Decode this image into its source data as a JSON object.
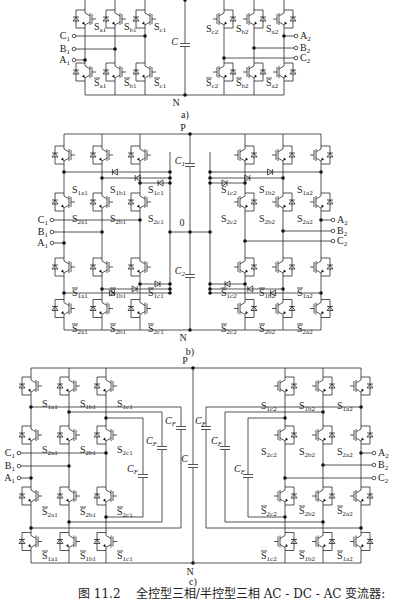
{
  "figure": {
    "number": "图 11.2",
    "caption": "全控型三相/半控型三相 AC - DC - AC 变流器:",
    "colors": {
      "line": "#2a2a2a",
      "background": "#ffffff",
      "node": "#111111"
    }
  },
  "panels": [
    {
      "id": "a",
      "label": "a)",
      "dc_nodes": {
        "bottom": "N"
      },
      "capacitor": "C",
      "left_terminals": [
        "C1",
        "B1",
        "A1"
      ],
      "right_terminals": [
        "A2",
        "B2",
        "C2"
      ],
      "left_upper_switches": [
        "Sa1",
        "Sb1",
        "Sc1"
      ],
      "left_lower_switches": [
        "S̄a1",
        "S̄b1",
        "S̄c1"
      ],
      "right_upper_switches": [
        "Sc2",
        "Sb2",
        "Sa2"
      ],
      "right_lower_switches": [
        "S̄c2",
        "S̄b2",
        "S̄a2"
      ]
    },
    {
      "id": "b",
      "label": "b)",
      "dc_nodes": {
        "top": "P",
        "mid": "0",
        "bottom": "N"
      },
      "capacitors": [
        "C1",
        "C2"
      ],
      "left_terminals": [
        "C1",
        "B1",
        "A1"
      ],
      "right_terminals": [
        "A2",
        "B2",
        "C2"
      ],
      "left_row1": [
        "S1a1",
        "S1b1",
        "S1c1"
      ],
      "left_row2": [
        "S2a1",
        "S2b1",
        "S2c1"
      ],
      "left_row3": [
        "S̄1a1",
        "S̄1b1",
        "S̄1c1"
      ],
      "left_row4": [
        "S̄2a1",
        "S̄2b1",
        "S̄2c1"
      ],
      "right_row1": [
        "S1c2",
        "S1b2",
        "S1a2"
      ],
      "right_row2": [
        "S2c2",
        "S2b2",
        "S2a2"
      ],
      "right_row3": [
        "S̄1c2",
        "S̄1b2",
        "S̄1a2"
      ],
      "right_row4": [
        "S̄2c2",
        "S̄2b2",
        "S̄2a2"
      ]
    },
    {
      "id": "c",
      "label": "c)",
      "dc_nodes": {
        "top": "P",
        "bottom": "N"
      },
      "capacitor": "C",
      "flying_capacitor": "CF",
      "left_terminals": [
        "C1",
        "B1",
        "A1"
      ],
      "right_terminals": [
        "A2",
        "B2",
        "C2"
      ],
      "left_row1": [
        "S1a1",
        "S1b1",
        "S1c1"
      ],
      "left_row2": [
        "S2a1",
        "S2b1",
        "S2c1"
      ],
      "left_row3": [
        "S̄2a1",
        "S̄2b1",
        "S̄2c1"
      ],
      "left_row4": [
        "S̄1a1",
        "S̄1b1",
        "S̄1c1"
      ],
      "right_row1": [
        "S1c2",
        "S1b2",
        "S1a2"
      ],
      "right_row2": [
        "S2c2",
        "S2b2",
        "S2a2"
      ],
      "right_row3": [
        "S̄2c2",
        "S̄2b2",
        "S̄2a2"
      ],
      "right_row4": [
        "S̄1c2",
        "S̄1b2",
        "S̄1a2"
      ]
    }
  ]
}
